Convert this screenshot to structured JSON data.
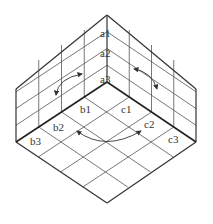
{
  "diagram": {
    "type": "isometric-cube-corner-grid",
    "labels": {
      "a1": "a1",
      "a2": "a2",
      "a3": "a3",
      "b1": "b1",
      "b2": "b2",
      "b3": "b3",
      "c1": "c1",
      "c2": "c2",
      "c3": "c3"
    },
    "colors": {
      "line": "#333333",
      "grid": "#555555",
      "background": "#ffffff"
    },
    "grid_divisions": 4
  }
}
